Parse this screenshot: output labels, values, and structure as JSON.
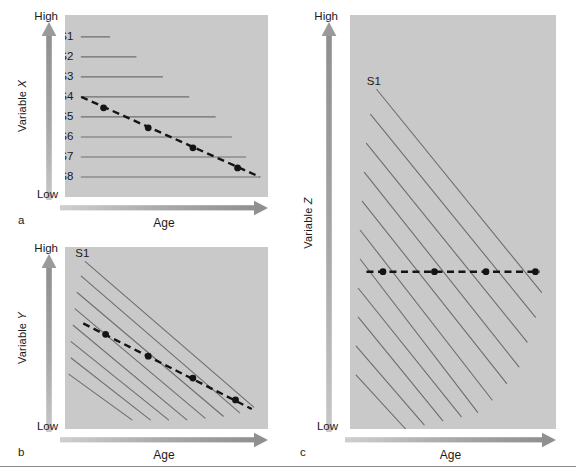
{
  "figure": {
    "background_color": "#ffffff",
    "plot_fill_color": "#c9c9c9",
    "arrow_color": "#9a9a9a",
    "series_line_color": "#6e6e6e",
    "trend_line_color": "#141414"
  },
  "panels": [
    {
      "id": "a",
      "letter": "a",
      "y_axis": {
        "label_prefix": "Variable ",
        "label_var": "X",
        "high_label": "High",
        "low_label": "Low"
      },
      "x_axis": {
        "label": "Age"
      },
      "series_labels": [
        "S1",
        "S2",
        "S3",
        "S4",
        "S5",
        "S6",
        "S7",
        "S8"
      ]
    },
    {
      "id": "b",
      "letter": "b",
      "y_axis": {
        "label_prefix": "Variable ",
        "label_var": "Y",
        "high_label": "High",
        "low_label": "Low"
      },
      "x_axis": {
        "label": "Age"
      },
      "series_labels": [
        "S1"
      ]
    },
    {
      "id": "c",
      "letter": "c",
      "y_axis": {
        "label_prefix": "Variable ",
        "label_var": "Z",
        "high_label": "High",
        "low_label": "Low"
      },
      "x_axis": {
        "label": "Age"
      },
      "series_labels": [
        "S1"
      ]
    }
  ],
  "chart_data": [
    {
      "type": "line",
      "panel": "a",
      "title": "",
      "xlabel": "Age",
      "ylabel": "Variable X",
      "xlim": [
        0,
        100
      ],
      "ylim": [
        0,
        100
      ],
      "xtick_labels": [],
      "ytick_labels": [
        "Low",
        "High"
      ],
      "grid": false,
      "legend": "inline-left",
      "description": "Eight cohort segments S1-S8 drawn as flat horizontal lines at descending levels of Variable X; each successive cohort is older and starts at the same age origin but extends further right. A dashed cross-sectional trend line with 4 filled markers runs from the left end of S4 downward to the right end of S8, indicating an apparent age-related decline.",
      "series": [
        {
          "name": "S1",
          "y": 88,
          "x_start": 8,
          "x_end": 22
        },
        {
          "name": "S2",
          "y": 77,
          "x_start": 8,
          "x_end": 35
        },
        {
          "name": "S3",
          "y": 66,
          "x_start": 8,
          "x_end": 48
        },
        {
          "name": "S4",
          "y": 55,
          "x_start": 8,
          "x_end": 61
        },
        {
          "name": "S5",
          "y": 44,
          "x_start": 8,
          "x_end": 74
        },
        {
          "name": "S6",
          "y": 33,
          "x_start": 8,
          "x_end": 82
        },
        {
          "name": "S7",
          "y": 22,
          "x_start": 8,
          "x_end": 89
        },
        {
          "name": "S8",
          "y": 11,
          "x_start": 8,
          "x_end": 96
        }
      ],
      "trend": {
        "name": "cross-sectional trend",
        "style": "dashed",
        "x": [
          8,
          96
        ],
        "y": [
          55,
          11
        ],
        "markers": [
          {
            "x": 19,
            "y": 49
          },
          {
            "x": 41,
            "y": 38
          },
          {
            "x": 63,
            "y": 27
          },
          {
            "x": 85,
            "y": 16
          }
        ]
      }
    },
    {
      "type": "line",
      "panel": "b",
      "title": "",
      "xlabel": "Age",
      "ylabel": "Variable Y",
      "xlim": [
        0,
        100
      ],
      "ylim": [
        0,
        100
      ],
      "xtick_labels": [],
      "ytick_labels": [
        "Low",
        "High"
      ],
      "grid": false,
      "legend": "inline-left",
      "description": "Eight parallel negatively-sloped cohort lines (S1 is the uppermost, longest); each cohort declines with age at the same rate. The dashed cross-sectional trend line with 4 filled markers has a shallower slope than the individual cohort lines.",
      "series": [
        {
          "name": "S1",
          "x_start": 10,
          "y_start": 92,
          "x_end": 93,
          "y_end": 12
        },
        {
          "name": "S2",
          "x_start": 8,
          "y_start": 84,
          "x_end": 86,
          "y_end": 9
        },
        {
          "name": "S3",
          "x_start": 6,
          "y_start": 75,
          "x_end": 78,
          "y_end": 7
        },
        {
          "name": "S4",
          "x_start": 5,
          "y_start": 66,
          "x_end": 69,
          "y_end": 6
        },
        {
          "name": "S5",
          "x_start": 4,
          "y_start": 57,
          "x_end": 60,
          "y_end": 5
        },
        {
          "name": "S6",
          "x_start": 3,
          "y_start": 48,
          "x_end": 51,
          "y_end": 5
        },
        {
          "name": "S7",
          "x_start": 3,
          "y_start": 39,
          "x_end": 42,
          "y_end": 5
        },
        {
          "name": "S8",
          "x_start": 2,
          "y_start": 30,
          "x_end": 33,
          "y_end": 5
        }
      ],
      "trend": {
        "name": "cross-sectional trend",
        "style": "dashed",
        "x": [
          9,
          92
        ],
        "y": [
          58,
          11
        ],
        "markers": [
          {
            "x": 20,
            "y": 52
          },
          {
            "x": 41,
            "y": 40
          },
          {
            "x": 63,
            "y": 28
          },
          {
            "x": 84,
            "y": 16
          }
        ]
      }
    },
    {
      "type": "line",
      "panel": "c",
      "title": "",
      "xlabel": "Age",
      "ylabel": "Variable Z",
      "xlim": [
        0,
        100
      ],
      "ylim": [
        0,
        100
      ],
      "xtick_labels": [],
      "ytick_labels": [
        "Low",
        "High"
      ],
      "grid": false,
      "legend": "inline-left",
      "description": "Eleven parallel negatively-sloped cohort lines (S1 uppermost) each showing decline of Variable Z with age. The dashed cross-sectional trend line is perfectly flat with 4 filled markers, showing no apparent age effect despite every cohort declining.",
      "series": [
        {
          "name": "S1",
          "x_start": 13,
          "y_start": 82,
          "x_end": 93,
          "y_end": 33
        },
        {
          "name": "S2",
          "x_start": 10,
          "y_start": 76,
          "x_end": 90,
          "y_end": 27
        },
        {
          "name": "S3",
          "x_start": 8,
          "y_start": 69,
          "x_end": 86,
          "y_end": 21
        },
        {
          "name": "S4",
          "x_start": 7,
          "y_start": 62,
          "x_end": 82,
          "y_end": 15
        },
        {
          "name": "S5",
          "x_start": 6,
          "y_start": 55,
          "x_end": 76,
          "y_end": 11
        },
        {
          "name": "S6",
          "x_start": 5,
          "y_start": 48,
          "x_end": 69,
          "y_end": 7
        },
        {
          "name": "S7",
          "x_start": 5,
          "y_start": 41,
          "x_end": 62,
          "y_end": 4
        },
        {
          "name": "S8",
          "x_start": 4,
          "y_start": 34,
          "x_end": 54,
          "y_end": 3
        },
        {
          "name": "S9",
          "x_start": 4,
          "y_start": 27,
          "x_end": 45,
          "y_end": 2
        },
        {
          "name": "S10",
          "x_start": 3,
          "y_start": 20,
          "x_end": 36,
          "y_end": 1
        },
        {
          "name": "S11",
          "x_start": 3,
          "y_start": 13,
          "x_end": 27,
          "y_end": 0
        }
      ],
      "trend": {
        "name": "cross-sectional trend",
        "style": "dashed",
        "x": [
          8,
          92
        ],
        "y": [
          38,
          38
        ],
        "markers": [
          {
            "x": 16,
            "y": 38
          },
          {
            "x": 41,
            "y": 38
          },
          {
            "x": 66,
            "y": 38
          },
          {
            "x": 90,
            "y": 38
          }
        ]
      }
    }
  ]
}
